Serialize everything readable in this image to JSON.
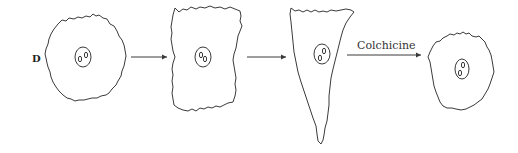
{
  "figure": {
    "panel_label": "D",
    "arrow_label": "Colchicine",
    "stages": [
      {
        "name": "rounded cell",
        "nucleoli": 2
      },
      {
        "name": "flattened rectangular cell",
        "nucleoli": 2
      },
      {
        "name": "elongated triangular cell",
        "nucleoli": 2
      },
      {
        "name": "re-rounded cell after colchicine",
        "nucleoli": 2
      }
    ],
    "arrows": [
      {
        "from": 1,
        "to": 2,
        "label": ""
      },
      {
        "from": 2,
        "to": 3,
        "label": ""
      },
      {
        "from": 3,
        "to": 4,
        "label": "Colchicine"
      }
    ],
    "colors": {
      "line": "#3a3a3a",
      "background": "#ffffff"
    }
  }
}
